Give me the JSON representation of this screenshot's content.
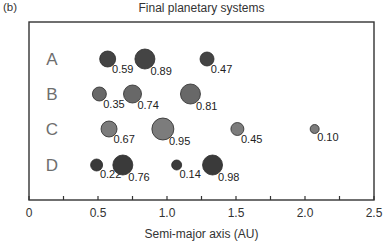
{
  "panel_label": "(b)",
  "chart_data": {
    "type": "scatter",
    "title": "Final planetary systems",
    "xlabel": "Semi-major axis (AU)",
    "ylabel": "",
    "xlim": [
      0,
      2.5
    ],
    "x_ticks": [
      0,
      0.25,
      0.5,
      0.75,
      1.0,
      1.25,
      1.5,
      1.75,
      2.0,
      2.25,
      2.5
    ],
    "x_tick_labels": [
      "0",
      "0.5",
      "1.0",
      "1.5",
      "2.0",
      "2.5"
    ],
    "x_tick_label_values": [
      0,
      0.5,
      1.0,
      1.5,
      2.0,
      2.5
    ],
    "grid": false,
    "legend": null,
    "note": "Circle size indicates planet mass; number beside each circle is its value label.",
    "series": [
      {
        "name": "A",
        "color": "#444444",
        "points": [
          {
            "a": 0.57,
            "label": "0.59",
            "r": 8
          },
          {
            "a": 0.84,
            "label": "0.89",
            "r": 10
          },
          {
            "a": 1.29,
            "label": "0.47",
            "r": 7
          }
        ]
      },
      {
        "name": "B",
        "color": "#686868",
        "points": [
          {
            "a": 0.51,
            "label": "0.35",
            "r": 7
          },
          {
            "a": 0.75,
            "label": "0.74",
            "r": 9
          },
          {
            "a": 1.17,
            "label": "0.81",
            "r": 10
          }
        ]
      },
      {
        "name": "C",
        "color": "#7c7c7c",
        "points": [
          {
            "a": 0.58,
            "label": "0.67",
            "r": 8
          },
          {
            "a": 0.97,
            "label": "0.95",
            "r": 11
          },
          {
            "a": 1.51,
            "label": "0.45",
            "r": 6.5
          },
          {
            "a": 2.07,
            "label": "0.10",
            "r": 4.5
          }
        ]
      },
      {
        "name": "D",
        "color": "#3a3a3a",
        "points": [
          {
            "a": 0.49,
            "label": "0.22",
            "r": 6
          },
          {
            "a": 0.68,
            "label": "0.76",
            "r": 10
          },
          {
            "a": 1.07,
            "label": "0.14",
            "r": 5
          },
          {
            "a": 1.33,
            "label": "0.98",
            "r": 10
          }
        ]
      }
    ]
  }
}
